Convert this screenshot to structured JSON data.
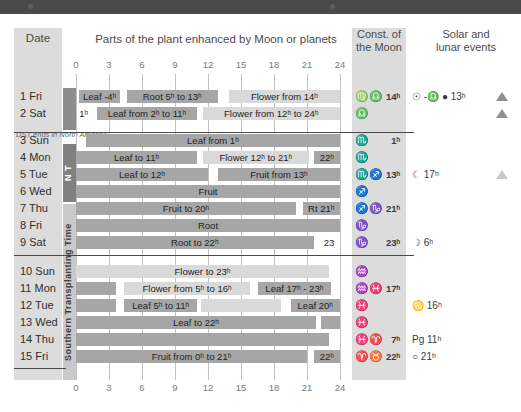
{
  "window": {
    "titlebar_color": "#4a4a4a"
  },
  "headers": {
    "date": "Date",
    "parts": "Parts of the plant enhanced by Moon or planets",
    "const_line1": "Const. of",
    "const_line2": "the Moon",
    "events_line1": "Solar and",
    "events_line2": "lunar events"
  },
  "side_labels": {
    "north": "N T",
    "south": "Southern Transplanting Time"
  },
  "notes": {
    "dst": "DST ends in North America"
  },
  "axis": {
    "ticks": [
      0,
      3,
      6,
      9,
      12,
      15,
      18,
      21,
      24
    ],
    "min": 0,
    "max": 24,
    "tick_labels": [
      "0",
      "3",
      "6",
      "9",
      "12",
      "15",
      "18",
      "21",
      "24"
    ]
  },
  "colors": {
    "bar_dark": "#a6a6a6",
    "bar_light": "#d9d9d9",
    "bar_very_dark": "#8c8c8c",
    "column_bg": "#dcdcdc",
    "grid": "#c2c2c2",
    "nt_band": "#808080",
    "stt_band": "#c9c9c9"
  },
  "chart_data": {
    "type": "bar",
    "title": "Parts of the plant enhanced by Moon or planets",
    "xlabel": "",
    "ylabel": "Date",
    "xlim": [
      0,
      24
    ],
    "grid": true,
    "categories": [
      "1 Fri",
      "2 Sat",
      "3 Sun",
      "4 Mon",
      "5 Tue",
      "6 Wed",
      "7 Thu",
      "8 Fri",
      "9 Sat",
      "10 Sun",
      "11 Mon",
      "12 Tue",
      "13 Wed",
      "14 Thu",
      "15 Fri"
    ],
    "series": [
      {
        "name": "1 Fri",
        "bars": [
          {
            "label": "Leaf -4ʰ",
            "start": 0.3,
            "end": 4.0,
            "tone": "dark"
          },
          {
            "label": "Root 5ʰ to 13ʰ",
            "start": 4.6,
            "end": 12.9,
            "tone": "dark"
          },
          {
            "label": "Flower from 14ʰ",
            "start": 13.9,
            "end": 24.0,
            "tone": "light"
          }
        ]
      },
      {
        "name": "2 Sat",
        "bars": [
          {
            "label": "1ʰ",
            "start": 0.0,
            "end": 1.4,
            "tone": "plain"
          },
          {
            "label": "Leaf from 2ʰ to 11ʰ",
            "start": 1.9,
            "end": 11.0,
            "tone": "dark"
          },
          {
            "label": "Flower from 12ʰ to 24ʰ",
            "start": 11.5,
            "end": 24.0,
            "tone": "light"
          }
        ]
      },
      {
        "name": "3 Sun",
        "bars": [
          {
            "label": "Leaf from 1ʰ",
            "start": 0.9,
            "end": 24.0,
            "tone": "dark"
          }
        ]
      },
      {
        "name": "4 Mon",
        "bars": [
          {
            "label": "Leaf to 11ʰ",
            "start": 0.0,
            "end": 11.0,
            "tone": "dark"
          },
          {
            "label": "Flower 12ʰ to 21ʰ",
            "start": 11.5,
            "end": 21.2,
            "tone": "light"
          },
          {
            "label": "22ʰ",
            "start": 21.6,
            "end": 24.0,
            "tone": "dark"
          }
        ]
      },
      {
        "name": "5 Tue",
        "bars": [
          {
            "label": "Leaf to 12ʰ",
            "start": 0.0,
            "end": 12.0,
            "tone": "dark"
          },
          {
            "label": "Fruit from 13ʰ",
            "start": 12.9,
            "end": 24.0,
            "tone": "dark"
          }
        ]
      },
      {
        "name": "6 Wed",
        "bars": [
          {
            "label": "Fruit",
            "start": 0.0,
            "end": 24.0,
            "tone": "dark"
          }
        ]
      },
      {
        "name": "7 Thu",
        "bars": [
          {
            "label": "Fruit to 20ʰ",
            "start": 0.0,
            "end": 20.0,
            "tone": "dark"
          },
          {
            "label": "Rt 21ʰ",
            "start": 20.6,
            "end": 24.0,
            "tone": "dark"
          }
        ]
      },
      {
        "name": "8 Fri",
        "bars": [
          {
            "label": "Root",
            "start": 0.0,
            "end": 24.0,
            "tone": "dark"
          }
        ]
      },
      {
        "name": "9 Sat",
        "bars": [
          {
            "label": "Root to 22ʰ",
            "start": 0.0,
            "end": 21.6,
            "tone": "dark"
          },
          {
            "label": "23",
            "start": 22.0,
            "end": 24.0,
            "tone": "plain"
          }
        ]
      },
      {
        "name": "10 Sun",
        "bars": [
          {
            "label": "Flower to 23ʰ",
            "start": 0.0,
            "end": 23.0,
            "tone": "light"
          }
        ]
      },
      {
        "name": "11 Mon",
        "bars": [
          {
            "label": "",
            "start": 0.0,
            "end": 3.6,
            "tone": "dark"
          },
          {
            "label": "Flower from 5ʰ to 16ʰ",
            "start": 4.4,
            "end": 15.8,
            "tone": "light"
          },
          {
            "label": "Leaf 17ʰ - 23ʰ",
            "start": 16.5,
            "end": 23.2,
            "tone": "dark"
          }
        ]
      },
      {
        "name": "12 Tue",
        "bars": [
          {
            "label": "",
            "start": 0.0,
            "end": 3.6,
            "tone": "dark"
          },
          {
            "label": "Leaf 5ʰ to 11ʰ",
            "start": 4.4,
            "end": 11.0,
            "tone": "dark"
          },
          {
            "label": "",
            "start": 11.4,
            "end": 18.6,
            "tone": "light"
          },
          {
            "label": "Leaf 20ʰ",
            "start": 19.5,
            "end": 24.0,
            "tone": "dark"
          }
        ]
      },
      {
        "name": "13 Wed",
        "bars": [
          {
            "label": "Leaf to 22ʰ",
            "start": 0.0,
            "end": 21.8,
            "tone": "dark"
          },
          {
            "label": "",
            "start": 22.3,
            "end": 24.0,
            "tone": "dark"
          }
        ]
      },
      {
        "name": "14 Thu",
        "bars": [
          {
            "label": "",
            "start": 0.0,
            "end": 23.0,
            "tone": "dark"
          }
        ]
      },
      {
        "name": "15 Fri",
        "bars": [
          {
            "label": "Fruit from 0ʰ to 21ʰ",
            "start": 0.0,
            "end": 21.0,
            "tone": "dark"
          },
          {
            "label": "22ʰ",
            "start": 21.6,
            "end": 24.0,
            "tone": "dark"
          }
        ]
      }
    ]
  },
  "constellations": [
    {
      "symbol": "♍♎",
      "hour": "14ʰ"
    },
    {
      "symbol": "♎",
      "hour": ""
    },
    {
      "symbol": "♏",
      "hour": "1ʰ"
    },
    {
      "symbol": "♏",
      "hour": ""
    },
    {
      "symbol": "♏♐",
      "hour": "13ʰ"
    },
    {
      "symbol": "♐",
      "hour": ""
    },
    {
      "symbol": "♐♑",
      "hour": "21ʰ"
    },
    {
      "symbol": "♑",
      "hour": ""
    },
    {
      "symbol": "♑",
      "hour": "23ʰ"
    },
    {
      "symbol": "♒",
      "hour": ""
    },
    {
      "symbol": "♒♓",
      "hour": "17ʰ"
    },
    {
      "symbol": "♓",
      "hour": ""
    },
    {
      "symbol": "♓",
      "hour": ""
    },
    {
      "symbol": "♓♈",
      "hour": "7ʰ"
    },
    {
      "symbol": "♈♉",
      "hour": "22ʰ"
    }
  ],
  "events": [
    {
      "row": 0,
      "text": "☉ -♎  ● 13ʰ"
    },
    {
      "row": 4,
      "text": "☾ 17ʰ"
    },
    {
      "row": 8,
      "text": "☽ 6ʰ"
    },
    {
      "row": 11,
      "text": "♋ 16ʰ"
    },
    {
      "row": 13,
      "text": "Pg 11ʰ"
    },
    {
      "row": 14,
      "text": "○ 21ʰ"
    }
  ],
  "triangles": [
    {
      "row": 0,
      "tone": "dk"
    },
    {
      "row": 1,
      "tone": "dk"
    },
    {
      "row": 4,
      "tone": "lt"
    }
  ]
}
